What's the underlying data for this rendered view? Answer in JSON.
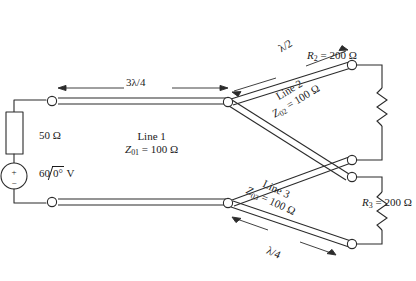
{
  "figure": {
    "stroke_color": "#2b2b2b",
    "text_color": "#1a1a1a",
    "background": "#ffffff"
  },
  "source": {
    "resistor_label": "50 Ω",
    "voltage_magnitude": "60",
    "voltage_angle": "0°",
    "voltage_unit": "V",
    "plus_sign": "+",
    "minus_sign": "−"
  },
  "lines": [
    {
      "name": "Line 1",
      "impedance_symbol": "Z",
      "impedance_subscript": "01",
      "impedance_value": "= 100 Ω",
      "length_label": "3λ/4"
    },
    {
      "name": "Line 2",
      "impedance_symbol": "Z",
      "impedance_subscript": "02",
      "impedance_value": "= 100 Ω",
      "length_label": "λ/2"
    },
    {
      "name": "Line 3",
      "impedance_symbol": "Z",
      "impedance_subscript": "03",
      "impedance_value": "= 100 Ω",
      "length_label": "λ/4"
    }
  ],
  "loads": [
    {
      "symbol": "R",
      "subscript": "2",
      "label": "= 200 Ω"
    },
    {
      "symbol": "R",
      "subscript": "3",
      "label": "= 200 Ω"
    }
  ]
}
